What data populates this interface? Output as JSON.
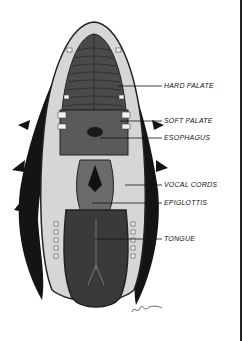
{
  "figure": {
    "labels": [
      {
        "id": "hard-palate",
        "text": "HARD PALATE",
        "x": 164,
        "y": 82,
        "line_from": 118,
        "line_y": 86
      },
      {
        "id": "soft-palate",
        "text": "SOFT PALATE",
        "x": 164,
        "y": 117,
        "line_from": 120,
        "line_y": 121
      },
      {
        "id": "esophagus",
        "text": "ESOPHAGUS",
        "x": 164,
        "y": 134,
        "line_from": 100,
        "line_y": 138
      },
      {
        "id": "vocal-cords",
        "text": "VOCAL CORDS",
        "x": 164,
        "y": 181,
        "line_from": 125,
        "line_y": 185
      },
      {
        "id": "epiglottis",
        "text": "EPIGLOTTIS",
        "x": 164,
        "y": 199,
        "line_from": 92,
        "line_y": 203
      },
      {
        "id": "tongue",
        "text": "TONGUE",
        "x": 164,
        "y": 235,
        "line_from": 95,
        "line_y": 239
      }
    ],
    "signature": "artist signature",
    "colors": {
      "fur": "#141414",
      "lip": "#d6d6d6",
      "palate": "#4a4a4a",
      "tongue": "#3a3a3a",
      "teeth": "#f2f2f2",
      "ink": "#111111"
    }
  }
}
